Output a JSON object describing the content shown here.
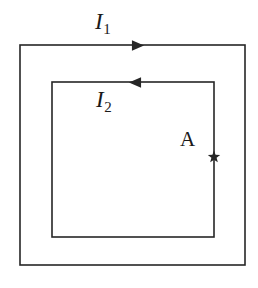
{
  "figure": {
    "type": "physics-circuit-diagram",
    "background_color": "#ffffff",
    "line_color": "#262626",
    "line_width": 1.6,
    "outer_loop": {
      "name": "outer-square-loop",
      "current_label": "I",
      "current_subscript": "1",
      "direction": "clockwise",
      "arrow_direction": "right",
      "x": 20,
      "y": 45,
      "width": 225,
      "height": 220
    },
    "inner_loop": {
      "name": "inner-square-loop",
      "current_label": "I",
      "current_subscript": "2",
      "direction": "counterclockwise",
      "arrow_direction": "left",
      "x": 52,
      "y": 82,
      "width": 162,
      "height": 155
    },
    "point_marker": {
      "name": "point-A",
      "label": "A",
      "marker": "star",
      "marker_points": 5,
      "x": 214,
      "y": 157,
      "size": 13
    },
    "arrows": [
      {
        "name": "outer-current-arrow",
        "x": 138,
        "y": 45.5,
        "direction": "right",
        "size": 11
      },
      {
        "name": "inner-current-arrow",
        "x": 135,
        "y": 82.5,
        "direction": "left",
        "size": 11
      }
    ]
  }
}
